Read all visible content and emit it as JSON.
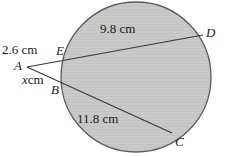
{
  "figure": {
    "background_color": "#ffffff",
    "circle": {
      "fill_color": "#c9c9c9",
      "stroke_color": "#5a5a5a",
      "center_x": 136,
      "center_y": 77,
      "radius": 75
    },
    "line_color": "#3a3a3a",
    "points": [
      {
        "id": "A",
        "label": "A",
        "x": 27,
        "y": 67,
        "on_circle": false
      },
      {
        "id": "B",
        "label": "B",
        "x": 62,
        "y": 82,
        "on_circle": true
      },
      {
        "id": "C",
        "label": "C",
        "x": 172,
        "y": 133,
        "on_circle": true
      },
      {
        "id": "D",
        "label": "D",
        "x": 203,
        "y": 35,
        "on_circle": true
      },
      {
        "id": "E",
        "label": "E",
        "x": 65,
        "y": 57,
        "on_circle": true
      }
    ],
    "segments": [
      {
        "id": "AD",
        "from": "A",
        "to": "D",
        "label": "9.8 cm"
      },
      {
        "id": "AC",
        "from": "A",
        "to": "C",
        "label": "11.8 cm"
      },
      {
        "id": "AE",
        "from": "A",
        "to": "E",
        "label": "2.6 cm"
      },
      {
        "id": "AB",
        "from": "A",
        "to": "B",
        "label": "x cm"
      }
    ],
    "labels": {
      "ae_measure": "2.6 cm",
      "ab_measure_value": "x",
      "ab_measure_unit": "cm",
      "ad_measure": "9.8 cm",
      "ac_measure": "11.8 cm",
      "point_a": "A",
      "point_b": "B",
      "point_c": "C",
      "point_d": "D",
      "point_e": "E"
    }
  }
}
